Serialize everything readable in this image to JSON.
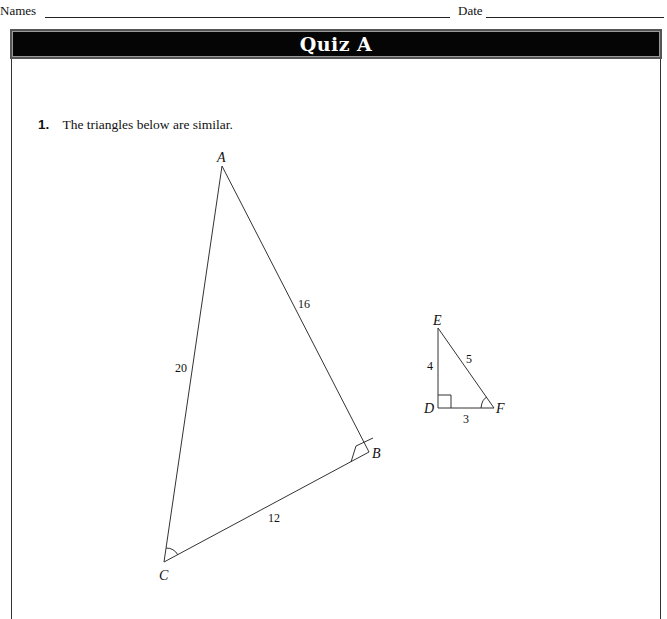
{
  "header": {
    "names_label": "Names",
    "date_label": "Date"
  },
  "banner": {
    "title": "Quiz A"
  },
  "question": {
    "number": "1.",
    "text": "The triangles below are similar."
  },
  "triangle_large": {
    "vertices": {
      "A": "A",
      "B": "B",
      "C": "C"
    },
    "sides": {
      "AC": "20",
      "AB": "16",
      "BC": "12"
    },
    "right_angle_at": "B",
    "marked_angle_at": "C"
  },
  "triangle_small": {
    "vertices": {
      "D": "D",
      "E": "E",
      "F": "F"
    },
    "sides": {
      "DE": "4",
      "EF": "5",
      "DF": "3"
    },
    "right_angle_at": "D",
    "marked_angle_at": "F"
  }
}
